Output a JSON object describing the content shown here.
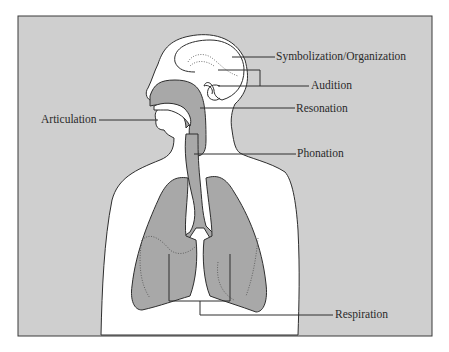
{
  "diagram": {
    "type": "anatomical-diagram",
    "labels": [
      {
        "id": "symbolization",
        "text": "Symbolization/Organization"
      },
      {
        "id": "audition",
        "text": "Audition"
      },
      {
        "id": "resonation",
        "text": "Resonation"
      },
      {
        "id": "articulation",
        "text": "Articulation"
      },
      {
        "id": "phonation",
        "text": "Phonation"
      },
      {
        "id": "respiration",
        "text": "Respiration"
      }
    ]
  },
  "colors": {
    "background": "#cfcfcf",
    "body": "#ffffff",
    "organ_fill": "#a8a8a8",
    "outline": "#2e2e2e",
    "page": "#ffffff"
  }
}
